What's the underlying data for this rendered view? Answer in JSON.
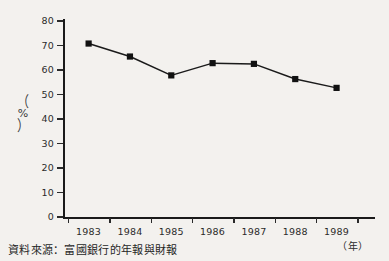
{
  "chart_data": {
    "type": "line",
    "title": "",
    "subtitle": "",
    "xlabel": "（年）",
    "ylabel": "（%）",
    "categories": [
      "1983",
      "1984",
      "1985",
      "1986",
      "1987",
      "1988",
      "1989"
    ],
    "values": [
      70.8,
      65.5,
      57.8,
      62.8,
      62.5,
      56.3,
      52.7
    ],
    "series": [
      {
        "name": "",
        "values": [
          70.8,
          65.5,
          57.8,
          62.8,
          62.5,
          56.3,
          52.7
        ]
      }
    ],
    "ylim": [
      0,
      80
    ],
    "ytick_step": 10,
    "yticks": [
      "0",
      "10",
      "20",
      "30",
      "40",
      "50",
      "60",
      "70",
      "80"
    ],
    "grid": false,
    "legend": "none",
    "marker": "filled-square",
    "line_color": "#1a1a1a",
    "marker_color": "#111111",
    "background_color": "#f3f1ee"
  },
  "source": {
    "label": "資料來源：富國銀行的年報與財報"
  },
  "axes": {
    "x_title": "（年）",
    "y_title_open_paren": "（",
    "y_title_symbol": "%",
    "y_title_close_paren": "）"
  }
}
